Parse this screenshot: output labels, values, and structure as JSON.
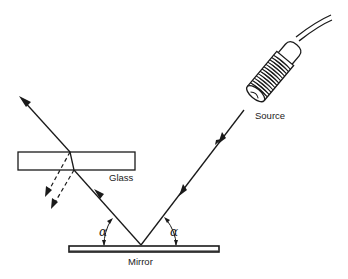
{
  "figure": {
    "type": "optics-diagram",
    "labels": {
      "source": "Source",
      "glass": "Glass",
      "mirror": "Mirror",
      "angle_left": "α",
      "angle_right": "α"
    },
    "colors": {
      "ink": "#1a1a1a",
      "background": "#ffffff"
    }
  }
}
